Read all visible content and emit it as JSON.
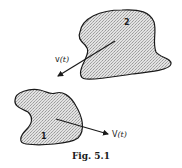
{
  "figure": {
    "caption": "Fig. 5.1",
    "regions": [
      {
        "id": "region-2",
        "label": "2"
      },
      {
        "id": "region-1",
        "label": "1"
      }
    ],
    "vectors": [
      {
        "id": "velocity-lower",
        "label_main": "v",
        "label_arg": "(t)",
        "region": "2",
        "direction": "down-left"
      },
      {
        "id": "velocity-upper",
        "label_main": "V",
        "label_arg": "(t)",
        "region": "1",
        "direction": "right"
      }
    ],
    "colors": {
      "stroke": "#1a1a1a",
      "fill": "#d4d4d4",
      "background": "#ffffff"
    }
  }
}
